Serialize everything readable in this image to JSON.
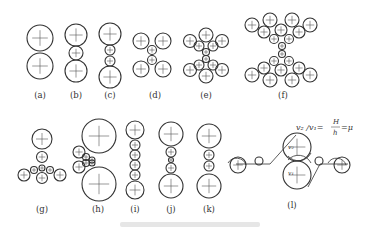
{
  "figure": {
    "type": "rolling-mill-roll-configurations",
    "panels": [
      {
        "id": "a",
        "label": "(a)"
      },
      {
        "id": "b",
        "label": "(b)"
      },
      {
        "id": "c",
        "label": "(c)"
      },
      {
        "id": "d",
        "label": "(d)"
      },
      {
        "id": "e",
        "label": "(e)"
      },
      {
        "id": "f",
        "label": "(f)"
      },
      {
        "id": "g",
        "label": "(g)"
      },
      {
        "id": "h",
        "label": "(h)"
      },
      {
        "id": "i",
        "label": "(i)"
      },
      {
        "id": "j",
        "label": "(j)"
      },
      {
        "id": "k",
        "label": "(k)"
      },
      {
        "id": "l",
        "label": "(l)"
      }
    ],
    "equation": {
      "lhs": "v₂ /v₁=",
      "frac_num": "H",
      "frac_den": "h",
      "rhs": "=μ"
    },
    "roll_labels": {
      "upper": "v₂",
      "lower": "v₁"
    },
    "colors": {
      "stroke": "#333333",
      "background": "#ffffff"
    }
  }
}
